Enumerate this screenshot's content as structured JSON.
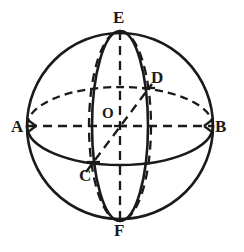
{
  "figure": {
    "type": "geometric-diagram",
    "stroke_color": "#1a1a1a",
    "background_color": "#ffffff",
    "labels": {
      "top_pole": "E",
      "bottom_pole": "F",
      "left_point": "A",
      "right_point": "B",
      "center": "O",
      "front_lower_point": "C",
      "back_upper_point": "D"
    },
    "geometry": {
      "outline_circle": {
        "cx": 120,
        "cy": 126,
        "r": 93
      },
      "equator_ellipse": {
        "cx": 120,
        "cy": 126,
        "rx": 93,
        "ry": 39
      },
      "meridian_solid_left": {
        "cx": 120,
        "cy": 126,
        "rx": 28,
        "ry": 95
      },
      "meridian_dashed_right": {
        "cx": 120,
        "cy": 126,
        "rx": 31,
        "ry": 95
      },
      "axis_vertical": {
        "from": "E",
        "to": "F"
      },
      "axis_horizontal": {
        "from": "A",
        "to": "B"
      },
      "axis_diagonal": {
        "from": "C",
        "to": "D"
      },
      "points": {
        "E": {
          "x": 120,
          "y": 31
        },
        "F": {
          "x": 120,
          "y": 221
        },
        "A": {
          "x": 28,
          "y": 126
        },
        "B": {
          "x": 212,
          "y": 126
        },
        "O": {
          "x": 120,
          "y": 126
        },
        "C": {
          "x": 93,
          "y": 162
        },
        "D": {
          "x": 148,
          "y": 88
        }
      }
    }
  }
}
